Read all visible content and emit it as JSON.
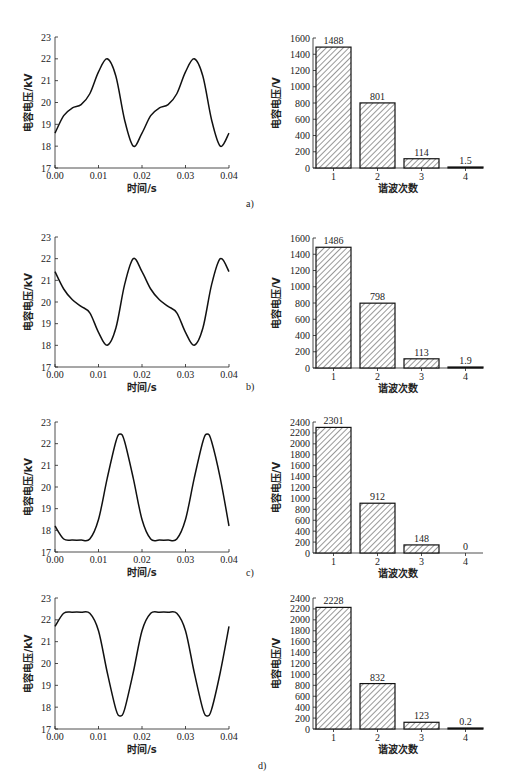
{
  "figure": {
    "panels": [
      {
        "label": "a)"
      },
      {
        "label": "b)"
      },
      {
        "label": "c)"
      },
      {
        "label": "d)"
      }
    ]
  },
  "chart_data": [
    {
      "id": "a-line",
      "type": "line",
      "xlabel": "时间/s",
      "ylabel": "电容电压/kV",
      "xlim": [
        0,
        0.04
      ],
      "ylim": [
        17,
        23
      ],
      "xticks": [
        "0.00",
        "0.01",
        "0.02",
        "0.03",
        "0.04"
      ],
      "yticks": [
        "17",
        "18",
        "19",
        "20",
        "21",
        "22",
        "23"
      ],
      "x": [
        0,
        0.002,
        0.004,
        0.006,
        0.008,
        0.01,
        0.012,
        0.014,
        0.016,
        0.018,
        0.02,
        0.022,
        0.024,
        0.026,
        0.028,
        0.03,
        0.032,
        0.034,
        0.036,
        0.038,
        0.04
      ],
      "values": [
        18.6,
        19.4,
        19.75,
        19.9,
        20.4,
        21.4,
        22.0,
        21.2,
        19.2,
        18.0,
        18.6,
        19.4,
        19.75,
        19.9,
        20.4,
        21.4,
        22.0,
        21.2,
        19.2,
        18.0,
        18.6
      ]
    },
    {
      "id": "a-bar",
      "type": "bar",
      "xlabel": "谐波次数",
      "ylabel": "电容电压/V",
      "ylim": [
        0,
        1600
      ],
      "yticks": [
        "0",
        "200",
        "400",
        "600",
        "800",
        "1000",
        "1200",
        "1400",
        "1600"
      ],
      "categories": [
        "1",
        "2",
        "3",
        "4"
      ],
      "values": [
        1488,
        801,
        114,
        1.5
      ],
      "value_labels": [
        "1488",
        "801",
        "114",
        "1.5"
      ]
    },
    {
      "id": "b-line",
      "type": "line",
      "xlabel": "时间/s",
      "ylabel": "电容电压/kV",
      "xlim": [
        0,
        0.04
      ],
      "ylim": [
        17,
        23
      ],
      "xticks": [
        "0.00",
        "0.01",
        "0.02",
        "0.03",
        "0.04"
      ],
      "yticks": [
        "17",
        "18",
        "19",
        "20",
        "21",
        "22",
        "23"
      ],
      "x": [
        0,
        0.002,
        0.004,
        0.006,
        0.008,
        0.01,
        0.012,
        0.014,
        0.016,
        0.018,
        0.02,
        0.022,
        0.024,
        0.026,
        0.028,
        0.03,
        0.032,
        0.034,
        0.036,
        0.038,
        0.04
      ],
      "values": [
        21.4,
        20.6,
        20.1,
        19.8,
        19.5,
        18.6,
        18.0,
        18.8,
        20.8,
        22.0,
        21.4,
        20.6,
        20.1,
        19.8,
        19.5,
        18.6,
        18.0,
        18.8,
        20.8,
        22.0,
        21.4
      ]
    },
    {
      "id": "b-bar",
      "type": "bar",
      "xlabel": "谐波次数",
      "ylabel": "电容电压/V",
      "ylim": [
        0,
        1600
      ],
      "yticks": [
        "0",
        "200",
        "400",
        "600",
        "800",
        "1000",
        "1200",
        "1400",
        "1600"
      ],
      "categories": [
        "1",
        "2",
        "3",
        "4"
      ],
      "values": [
        1486,
        798,
        113,
        1.9
      ],
      "value_labels": [
        "1486",
        "798",
        "113",
        "1.9"
      ]
    },
    {
      "id": "c-line",
      "type": "line",
      "xlabel": "时间/s",
      "ylabel": "电容电压/kV",
      "xlim": [
        0,
        0.04
      ],
      "ylim": [
        17,
        23
      ],
      "xticks": [
        "0.00",
        "0.01",
        "0.02",
        "0.03",
        "0.04"
      ],
      "yticks": [
        "17",
        "18",
        "19",
        "20",
        "21",
        "22",
        "23"
      ],
      "x": [
        0,
        0.002,
        0.004,
        0.006,
        0.008,
        0.01,
        0.012,
        0.014,
        0.015,
        0.016,
        0.018,
        0.02,
        0.022,
        0.024,
        0.026,
        0.028,
        0.03,
        0.032,
        0.034,
        0.035,
        0.036,
        0.038,
        0.04
      ],
      "values": [
        18.2,
        17.6,
        17.55,
        17.55,
        17.6,
        18.5,
        20.4,
        22.1,
        22.45,
        22.1,
        20.4,
        18.5,
        17.6,
        17.55,
        17.55,
        17.6,
        18.5,
        20.4,
        22.1,
        22.45,
        22.1,
        20.4,
        18.2
      ]
    },
    {
      "id": "c-bar",
      "type": "bar",
      "xlabel": "谐波次数",
      "ylabel": "电容电压/V",
      "ylim": [
        0,
        2400
      ],
      "yticks": [
        "0",
        "200",
        "400",
        "600",
        "800",
        "1000",
        "1200",
        "1400",
        "1600",
        "1800",
        "2000",
        "2200",
        "2400"
      ],
      "categories": [
        "1",
        "2",
        "3",
        "4"
      ],
      "values": [
        2301,
        912,
        148,
        0
      ],
      "value_labels": [
        "2301",
        "912",
        "148",
        "0"
      ]
    },
    {
      "id": "d-line",
      "type": "line",
      "xlabel": "时间/s",
      "ylabel": "电容电压/kV",
      "xlim": [
        0,
        0.04
      ],
      "ylim": [
        17,
        23
      ],
      "xticks": [
        "0.00",
        "0.01",
        "0.02",
        "0.03",
        "0.04"
      ],
      "yticks": [
        "17",
        "18",
        "19",
        "20",
        "21",
        "22",
        "23"
      ],
      "x": [
        0,
        0.002,
        0.004,
        0.006,
        0.008,
        0.01,
        0.012,
        0.014,
        0.015,
        0.016,
        0.018,
        0.02,
        0.022,
        0.024,
        0.026,
        0.028,
        0.03,
        0.032,
        0.034,
        0.035,
        0.036,
        0.038,
        0.04
      ],
      "values": [
        21.7,
        22.3,
        22.35,
        22.35,
        22.3,
        21.5,
        19.6,
        17.9,
        17.6,
        17.9,
        19.6,
        21.5,
        22.3,
        22.35,
        22.35,
        22.3,
        21.5,
        19.6,
        17.9,
        17.6,
        17.9,
        19.6,
        21.7
      ]
    },
    {
      "id": "d-bar",
      "type": "bar",
      "xlabel": "谐波次数",
      "ylabel": "电容电压/V",
      "ylim": [
        0,
        2400
      ],
      "yticks": [
        "0",
        "200",
        "400",
        "600",
        "800",
        "1000",
        "1200",
        "1400",
        "1600",
        "1800",
        "2000",
        "2200",
        "2400"
      ],
      "categories": [
        "1",
        "2",
        "3",
        "4"
      ],
      "values": [
        2228,
        832,
        123,
        0.2
      ],
      "value_labels": [
        "2228",
        "832",
        "123",
        "0.2"
      ]
    }
  ]
}
